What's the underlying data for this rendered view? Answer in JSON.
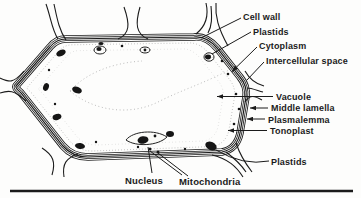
{
  "figure": {
    "labels": {
      "cell_wall": "Cell wall",
      "plastids_top": "Plastids",
      "cytoplasm": "Cytoplasm",
      "intercellular_space": "Intercellular space",
      "vacuole": "Vacuole",
      "middle_lamella": "Middle lamella",
      "plasmalemma": "Plasmalemma",
      "tonoplast": "Tonoplast",
      "plastids_bottom": "Plastids",
      "nucleus": "Nucleus",
      "mitochondria": "Mitochondria"
    },
    "colors": {
      "ink": "#1b1b1b",
      "paper": "#fdfdfc",
      "stipple": "#8f8f8f"
    }
  }
}
